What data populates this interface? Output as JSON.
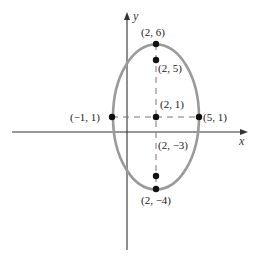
{
  "diagram": {
    "type": "ellipse-on-axes",
    "axes": {
      "x_label": "x",
      "y_label": "y"
    },
    "ellipse": {
      "center": [
        2,
        1
      ],
      "semi_major_vertical": 5,
      "semi_minor_horizontal": 3,
      "stroke_color": "#9a9a9a"
    },
    "points": [
      {
        "id": "top-vertex",
        "label": "(2, 6)",
        "x": 2,
        "y": 6
      },
      {
        "id": "upper-focus",
        "label": "(2, 5)",
        "x": 2,
        "y": 5
      },
      {
        "id": "center",
        "label": "(2, 1)",
        "x": 2,
        "y": 1
      },
      {
        "id": "left-covertex",
        "label": "(−1, 1)",
        "x": -1,
        "y": 1
      },
      {
        "id": "right-covertex",
        "label": "(5, 1)",
        "x": 5,
        "y": 1
      },
      {
        "id": "lower-focus",
        "label": "(2, −3)",
        "x": 2,
        "y": -3
      },
      {
        "id": "bottom-vertex",
        "label": "(2, −4)",
        "x": 2,
        "y": -4
      }
    ],
    "dashed_lines": [
      {
        "from": [
          -1,
          1
        ],
        "to": [
          5,
          1
        ]
      },
      {
        "from": [
          2,
          6
        ],
        "to": [
          2,
          -4
        ]
      }
    ]
  }
}
